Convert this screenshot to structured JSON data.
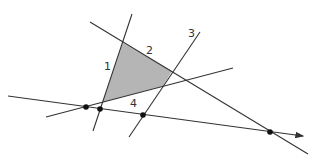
{
  "diagram": {
    "colors": {
      "line": "#333333",
      "fill": "#b5b5b5",
      "dot": "#111111",
      "background": "#ffffff"
    },
    "labels": {
      "line1": "1",
      "line2": "2",
      "line3": "3",
      "line4": "4"
    },
    "region": {
      "name": "shaded quadrilateral",
      "vertices": [
        [
          123,
          43
        ],
        [
          172,
          71
        ],
        [
          163,
          86
        ],
        [
          103,
          102
        ]
      ]
    },
    "lines": [
      {
        "id": "line1",
        "label": "1",
        "from": [
          132,
          14
        ],
        "to": [
          93,
          131
        ]
      },
      {
        "id": "line2",
        "label": "2",
        "from": [
          90,
          22
        ],
        "to": [
          308,
          154
        ]
      },
      {
        "id": "line3",
        "label": "3",
        "from": [
          200,
          32
        ],
        "to": [
          129,
          137
        ]
      },
      {
        "id": "line4",
        "label": "4",
        "from": [
          46,
          117
        ],
        "to": [
          233,
          68
        ]
      },
      {
        "id": "baseline",
        "label": "",
        "from": [
          8,
          96
        ],
        "to": [
          305,
          136
        ],
        "arrow": true
      }
    ],
    "points": [
      {
        "id": "p-line4-baseline",
        "at": [
          86,
          107
        ]
      },
      {
        "id": "p-line1-baseline",
        "at": [
          100,
          109
        ]
      },
      {
        "id": "p-line3-baseline",
        "at": [
          143,
          115
        ]
      },
      {
        "id": "p-line2-baseline",
        "at": [
          270,
          132
        ]
      }
    ]
  }
}
